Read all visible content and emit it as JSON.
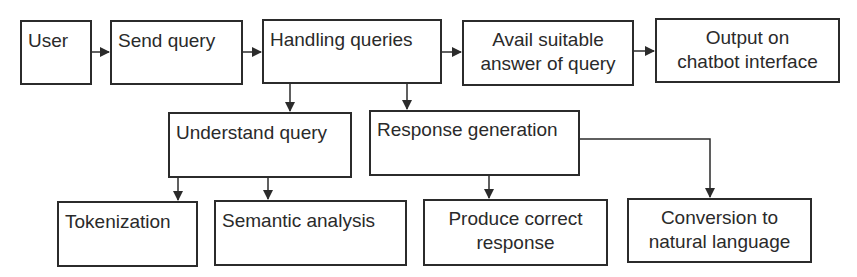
{
  "diagram": {
    "title": "",
    "nodes": [
      {
        "id": "user",
        "label": "User"
      },
      {
        "id": "send_query",
        "label": "Send query"
      },
      {
        "id": "handling_queries",
        "label": "Handling queries"
      },
      {
        "id": "avail_answer",
        "label": "Avail suitable answer of query",
        "lines": [
          "Avail suitable",
          "answer of query"
        ]
      },
      {
        "id": "output_interface",
        "label": "Output on chatbot interface",
        "lines": [
          "Output on",
          "chatbot interface"
        ]
      },
      {
        "id": "understand_query",
        "label": "Understand query"
      },
      {
        "id": "response_generation",
        "label": "Response generation"
      },
      {
        "id": "tokenization",
        "label": "Tokenization"
      },
      {
        "id": "semantic_analysis",
        "label": "Semantic analysis"
      },
      {
        "id": "produce_response",
        "label": "Produce correct response",
        "lines": [
          "Produce correct",
          "response"
        ]
      },
      {
        "id": "conversion_nl",
        "label": "Conversion to natural language",
        "lines": [
          "Conversion to",
          "natural language"
        ]
      }
    ],
    "edges": [
      {
        "from": "user",
        "to": "send_query"
      },
      {
        "from": "send_query",
        "to": "handling_queries"
      },
      {
        "from": "handling_queries",
        "to": "avail_answer"
      },
      {
        "from": "avail_answer",
        "to": "output_interface"
      },
      {
        "from": "handling_queries",
        "to": "understand_query"
      },
      {
        "from": "handling_queries",
        "to": "response_generation"
      },
      {
        "from": "understand_query",
        "to": "tokenization"
      },
      {
        "from": "understand_query",
        "to": "semantic_analysis"
      },
      {
        "from": "response_generation",
        "to": "produce_response"
      },
      {
        "from": "response_generation",
        "to": "conversion_nl"
      }
    ],
    "colors": {
      "stroke": "#2b2b2b",
      "text": "#2a2a2a",
      "background": "#ffffff"
    }
  }
}
